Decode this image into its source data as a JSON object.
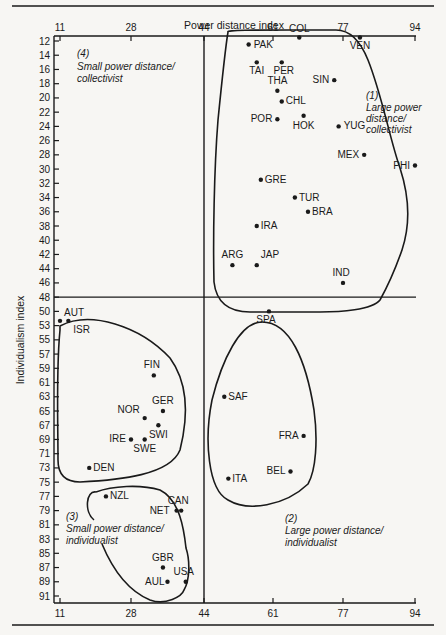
{
  "chart_data": {
    "type": "scatter",
    "title": "",
    "xlabel": "Power distance index",
    "ylabel": "Individualism index",
    "x_ticks": [
      11,
      28,
      44,
      61,
      77,
      94
    ],
    "y_ticks": [
      12,
      14,
      16,
      18,
      20,
      22,
      24,
      26,
      28,
      30,
      32,
      34,
      36,
      38,
      40,
      42,
      44,
      46,
      48,
      50,
      53,
      55,
      57,
      59,
      61,
      63,
      65,
      67,
      69,
      71,
      73,
      75,
      77,
      79,
      81,
      83,
      85,
      87,
      89,
      91
    ],
    "xlim": [
      11,
      94
    ],
    "divider_x": 44,
    "divider_y": 48,
    "grid": false,
    "legend": "none",
    "quadrants": [
      {
        "id": "1",
        "number": "(1)",
        "line1": "Large power",
        "line2": "distance/",
        "line3": "collectivist"
      },
      {
        "id": "2",
        "number": "(2)",
        "line1": "Large power distance/",
        "line2": "individualist"
      },
      {
        "id": "3",
        "number": "(3)",
        "line1": "Small power distance/",
        "line2": "individualist"
      },
      {
        "id": "4",
        "number": "(4)",
        "line1": "Small power distance/",
        "line2": "collectivist"
      }
    ],
    "points": [
      {
        "label": "PAK",
        "x": 55,
        "y": 12.5,
        "cluster": 1
      },
      {
        "label": "COL",
        "x": 67,
        "y": 11.5,
        "cluster": 1
      },
      {
        "label": "VEN",
        "x": 81,
        "y": 11.5,
        "cluster": 1
      },
      {
        "label": "TAI",
        "x": 57,
        "y": 15,
        "cluster": 1
      },
      {
        "label": "PER",
        "x": 63,
        "y": 15,
        "cluster": 1
      },
      {
        "label": "SIN",
        "x": 75,
        "y": 17.5,
        "cluster": 1
      },
      {
        "label": "THA",
        "x": 62,
        "y": 19,
        "cluster": 1
      },
      {
        "label": "CHL",
        "x": 63,
        "y": 20.5,
        "cluster": 1
      },
      {
        "label": "POR",
        "x": 62,
        "y": 23,
        "cluster": 1
      },
      {
        "label": "HOK",
        "x": 68,
        "y": 22.5,
        "cluster": 1
      },
      {
        "label": "YUG",
        "x": 76,
        "y": 24,
        "cluster": 1
      },
      {
        "label": "MEX",
        "x": 82,
        "y": 28,
        "cluster": 1
      },
      {
        "label": "PHI",
        "x": 94,
        "y": 29.5,
        "cluster": 1
      },
      {
        "label": "GRE",
        "x": 58,
        "y": 31.5,
        "cluster": 1
      },
      {
        "label": "TUR",
        "x": 66,
        "y": 34,
        "cluster": 1
      },
      {
        "label": "BRA",
        "x": 69,
        "y": 36,
        "cluster": 1
      },
      {
        "label": "IRA",
        "x": 57,
        "y": 38,
        "cluster": 1
      },
      {
        "label": "ARG",
        "x": 51,
        "y": 43.5,
        "cluster": 1
      },
      {
        "label": "JAP",
        "x": 57,
        "y": 43.5,
        "cluster": 1
      },
      {
        "label": "IND",
        "x": 77,
        "y": 46,
        "cluster": 1
      },
      {
        "label": "SPA",
        "x": 60,
        "y": 50,
        "cluster": 2
      },
      {
        "label": "SAF",
        "x": 49,
        "y": 63,
        "cluster": 2
      },
      {
        "label": "FRA",
        "x": 68,
        "y": 68.5,
        "cluster": 2
      },
      {
        "label": "BEL",
        "x": 65,
        "y": 73.5,
        "cluster": 2
      },
      {
        "label": "ITA",
        "x": 50,
        "y": 74.5,
        "cluster": 2
      },
      {
        "label": "NZL",
        "x": 22,
        "y": 77,
        "cluster": 3
      },
      {
        "label": "CAN",
        "x": 39,
        "y": 79,
        "cluster": 3
      },
      {
        "label": "NET",
        "x": 38,
        "y": 79,
        "cluster": 3
      },
      {
        "label": "GBR",
        "x": 35,
        "y": 87,
        "cluster": 3
      },
      {
        "label": "AUL",
        "x": 36,
        "y": 89,
        "cluster": 3
      },
      {
        "label": "USA",
        "x": 40,
        "y": 89,
        "cluster": 3
      },
      {
        "label": "AUT",
        "x": 11,
        "y": 52,
        "cluster": 4
      },
      {
        "label": "ISR",
        "x": 13,
        "y": 52,
        "cluster": 4
      },
      {
        "label": "FIN",
        "x": 33,
        "y": 60,
        "cluster": 4
      },
      {
        "label": "GER",
        "x": 35,
        "y": 65,
        "cluster": 4
      },
      {
        "label": "NOR",
        "x": 31,
        "y": 66,
        "cluster": 4
      },
      {
        "label": "SWI",
        "x": 34,
        "y": 67,
        "cluster": 4
      },
      {
        "label": "IRE",
        "x": 28,
        "y": 69,
        "cluster": 4
      },
      {
        "label": "SWE",
        "x": 31,
        "y": 69,
        "cluster": 4
      },
      {
        "label": "DEN",
        "x": 18,
        "y": 73,
        "cluster": 4
      }
    ]
  }
}
